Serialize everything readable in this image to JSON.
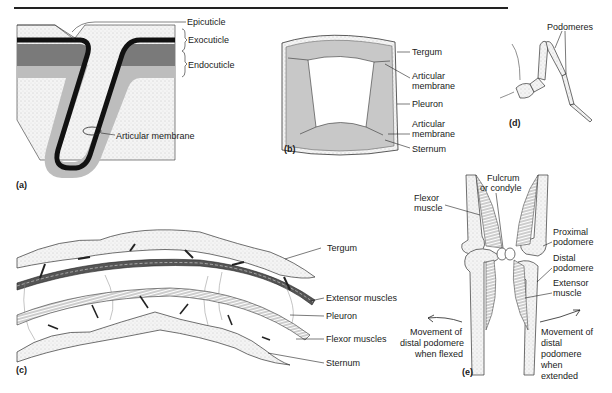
{
  "figure": {
    "panels": {
      "a": {
        "tag": "(a)",
        "labels": {
          "epicuticle": "Epicuticle",
          "exocuticle": "Exocuticle",
          "endocuticle": "Endocuticle",
          "articular_membrane": "Articular membrane"
        }
      },
      "b": {
        "tag": "(b)",
        "labels": {
          "tergum": "Tergum",
          "articular_membrane_top_1": "Articular",
          "articular_membrane_top_2": "membrane",
          "pleuron": "Pleuron",
          "articular_membrane_bottom_1": "Articular",
          "articular_membrane_bottom_2": "membrane",
          "sternum": "Sternum"
        }
      },
      "c": {
        "tag": "(c)",
        "labels": {
          "tergum": "Tergum",
          "extensor_muscles": "Extensor muscles",
          "pleuron": "Pleuron",
          "flexor_muscles": "Flexor muscles",
          "sternum": "Sternum"
        }
      },
      "d": {
        "tag": "(d)",
        "labels": {
          "podomeres": "Podomeres"
        }
      },
      "e": {
        "tag": "(e)",
        "labels": {
          "flexor_muscle_1": "Flexor",
          "flexor_muscle_2": "muscle",
          "fulcrum_1": "Fulcrum",
          "fulcrum_2": "or condyle",
          "proximal_1": "Proximal",
          "proximal_2": "podomere",
          "distal_1": "Distal",
          "distal_2": "podomere",
          "extensor_1": "Extensor",
          "extensor_2": "muscle",
          "flexed_1": "Movement of",
          "flexed_2": "distal podomere",
          "flexed_3": "when flexed",
          "extended_1": "Movement of",
          "extended_2": "distal",
          "extended_3": "podomere",
          "extended_4": "when",
          "extended_5": "extended"
        }
      }
    },
    "colors": {
      "epicuticle": "#111111",
      "exocuticle": "#7a7a7a",
      "endocuticle": "#bdbdbd",
      "stipple": "#e9e9e9"
    }
  }
}
